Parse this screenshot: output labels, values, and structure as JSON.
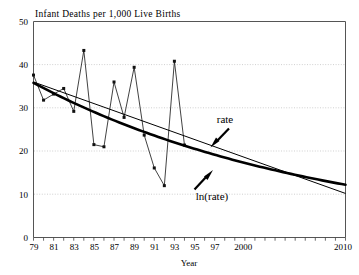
{
  "chart_data": {
    "type": "line",
    "title": "Infant Deaths per 1,000 Live Births",
    "xlabel": "Year",
    "ylabel": "",
    "xlim": [
      1979,
      2010
    ],
    "ylim": [
      0,
      50
    ],
    "grid": true,
    "legend_position": "inline-annotations",
    "y_ticks": [
      "0",
      "10",
      "20",
      "30",
      "40",
      "50"
    ],
    "y_tick_values": [
      0,
      10,
      20,
      30,
      40,
      50
    ],
    "x_tick_labels": [
      "79",
      "81",
      "83",
      "85",
      "87",
      "89",
      "91",
      "93",
      "95",
      "97",
      "2000",
      "2010"
    ],
    "x_tick_values": [
      1979,
      1981,
      1983,
      1985,
      1987,
      1989,
      1991,
      1993,
      1995,
      1997,
      2000,
      2010
    ],
    "x_minor_ticks": [
      1979,
      1980,
      1981,
      1982,
      1983,
      1984,
      1985,
      1986,
      1987,
      1988,
      1989,
      1990,
      1991,
      1992,
      1993,
      1994,
      1995,
      1996,
      1997,
      1998,
      1999,
      2000,
      2001,
      2002,
      2003,
      2004,
      2005,
      2006,
      2007,
      2008,
      2009,
      2010
    ],
    "series": [
      {
        "name": "observed",
        "kind": "markers-line",
        "x": [
          1979,
          1980,
          1981,
          1982,
          1983,
          1984,
          1985,
          1986,
          1987,
          1988,
          1989,
          1990,
          1991,
          1992,
          1993,
          1994
        ],
        "values": [
          37.6,
          31.8,
          33.2,
          34.5,
          29.2,
          43.3,
          21.5,
          21.0,
          36.0,
          27.8,
          39.4,
          23.7,
          16.1,
          12.0,
          40.8,
          21.4
        ]
      },
      {
        "name": "rate",
        "kind": "trend-linear",
        "x": [
          1979,
          2010
        ],
        "values": [
          36.0,
          10.2
        ]
      },
      {
        "name": "ln(rate)",
        "kind": "trend-exponential",
        "x": [
          1979,
          2010
        ],
        "values": [
          35.8,
          12.2
        ]
      }
    ],
    "annotations": [
      {
        "label": "rate",
        "target_series": "rate"
      },
      {
        "label": "ln(rate)",
        "target_series": "ln(rate)"
      }
    ]
  }
}
